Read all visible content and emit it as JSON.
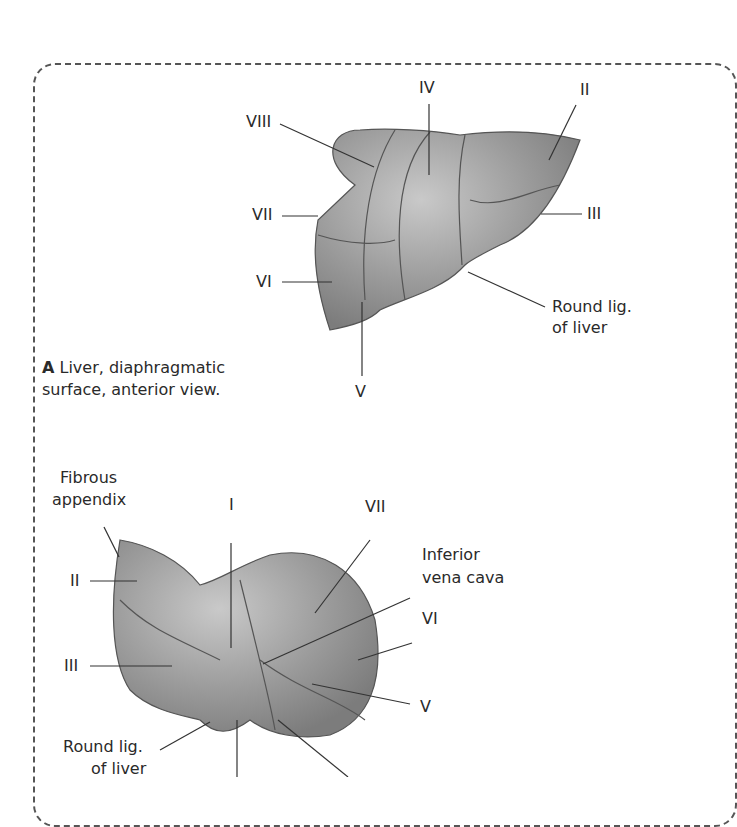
{
  "figure_A": {
    "caption_letter": "A",
    "caption_text": "Liver, diaphragmatic",
    "caption_text2": "surface, anterior view.",
    "labels": {
      "iv": "IV",
      "ii": "II",
      "viii": "VIII",
      "vii": "VII",
      "iii": "III",
      "vi": "VI",
      "v": "V",
      "round_lig_1": "Round lig.",
      "round_lig_2": "of liver"
    }
  },
  "figure_B": {
    "labels": {
      "fibrous_1": "Fibrous",
      "fibrous_2": "appendix",
      "i": "I",
      "vii": "VII",
      "ivc_1": "Inferior",
      "ivc_2": "vena cava",
      "ii": "II",
      "vi": "VI",
      "iii": "III",
      "v": "V",
      "round_lig_1": "Round lig.",
      "round_lig_2": "of liver"
    }
  }
}
